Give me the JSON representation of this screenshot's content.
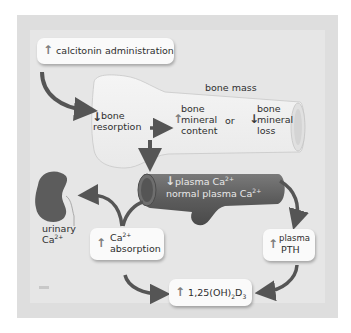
{
  "diagram": {
    "colors": {
      "frame": "#dedede",
      "inner": "#e6e6e6",
      "arrow": "#555555",
      "vessel": "#5a5a5a",
      "kidney": "#5c5c5c",
      "bone": "#f0f0f0",
      "box": "#fafafa"
    },
    "calcitonin_box": {
      "icon": "up-arrow",
      "label": "calcitonin administration"
    },
    "bone_mass_label": "bone mass",
    "bone_resorption": {
      "icon": "down-arrow",
      "line1": "bone",
      "line2": "resorption"
    },
    "bone_mineral_content": {
      "icon": "up-arrow",
      "line1": "bone",
      "line2": "mineral",
      "line3": "content"
    },
    "or_label": "or",
    "bone_mineral_loss": {
      "icon": "down-arrow",
      "line1": "bone",
      "line2": "mineral",
      "line3": "loss"
    },
    "plasma_ca": {
      "icon": "down-arrow",
      "label": "plasma Ca",
      "sup": "2+"
    },
    "normal_plasma_ca": {
      "label": "normal plasma Ca",
      "sup": "2+"
    },
    "urinary_ca": {
      "line1": "urinary",
      "line2": "Ca",
      "sup": "2+"
    },
    "ca_absorption_box": {
      "icon": "up-arrow",
      "line1": "Ca",
      "sup": "2+",
      "line2": "absorption"
    },
    "plasma_pth_box": {
      "icon": "up-arrow",
      "line1": "plasma",
      "line2": "PTH"
    },
    "vitamin_d_box": {
      "icon": "up-arrow",
      "prefix": "1,25(OH)",
      "sub1": "2",
      "mid": "D",
      "sub2": "3"
    }
  }
}
